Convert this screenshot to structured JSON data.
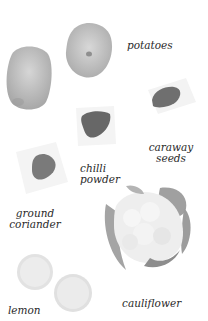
{
  "ingredients": [
    {
      "id": "potatoes",
      "label": "potatoes"
    },
    {
      "id": "caraway-seeds",
      "label_line1": "caraway",
      "label_line2": "seeds"
    },
    {
      "id": "chilli-powder",
      "label_line1": "chilli",
      "label_line2": "powder"
    },
    {
      "id": "ground-coriander",
      "label_line1": "ground",
      "label_line2": "coriander"
    },
    {
      "id": "cauliflower",
      "label": "cauliflower"
    },
    {
      "id": "lemon",
      "label": "lemon"
    }
  ],
  "colors": {
    "potato": "#c9c9c9",
    "spice_dark": "#6e6e6e",
    "spice_mid": "#7c7c7c",
    "paper": "#f4f4f4",
    "cauliflower_leaf": "#a9a9a9",
    "cauliflower_floret": "#efefef",
    "lemon": "#e8e8e8"
  }
}
